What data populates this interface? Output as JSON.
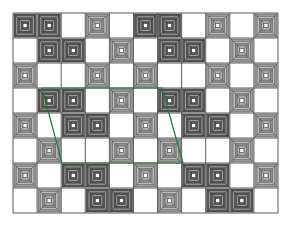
{
  "diagram": {
    "type": "tiling-grid",
    "grid": {
      "x": 13,
      "y": 13,
      "width": 265,
      "height": 200,
      "cols": 11,
      "rows": 8,
      "line_color": "#333333",
      "background": "#ffffff"
    },
    "legend_codes": {
      "D": "dark concentric-square tile",
      "L": "light pyramid tile with diagonals",
      "_": "empty white cell"
    },
    "rows": [
      "DD_L_DD_L_L",
      "_DD_L_DD_L_",
      "L__L_L__L_L",
      "_DD_L_DD_L_",
      "L_DD_L_DD_L",
      "_L__L_L__L_",
      "L_DD_L_DD_L",
      "_L_DD_L_DD_"
    ],
    "tile_styles": {
      "dark": {
        "outer": "#3a3a3a",
        "ring_dark": "#4a4a4a",
        "ring_light": "#a8a8a8",
        "rings": 6
      },
      "light": {
        "outer": "#555555",
        "ring_dark": "#666666",
        "ring_light": "#d8d8d8",
        "rings": 5
      }
    },
    "overlay": {
      "name": "parallelogram",
      "color": "#1e7a3a",
      "stroke_width": 1.2,
      "points": [
        [
          42,
          88
        ],
        [
          162,
          88
        ],
        [
          183,
          163
        ],
        [
          62,
          163
        ]
      ]
    }
  }
}
